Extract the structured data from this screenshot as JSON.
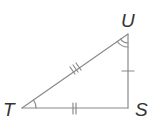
{
  "diagram": {
    "type": "right-triangle",
    "vertices": {
      "T": {
        "label": "T",
        "x": 22,
        "y": 108
      },
      "S": {
        "label": "S",
        "x": 128,
        "y": 108
      },
      "U": {
        "label": "U",
        "x": 128,
        "y": 34
      }
    },
    "sides": [
      {
        "from": "T",
        "to": "U",
        "tick_marks": 3
      },
      {
        "from": "T",
        "to": "S",
        "tick_marks": 2
      },
      {
        "from": "U",
        "to": "S",
        "tick_marks": 1
      }
    ],
    "angle_marks": [
      {
        "vertex": "T",
        "arcs": 1
      },
      {
        "vertex": "U",
        "arcs": 2
      }
    ],
    "colors": {
      "stroke": "#8a8a8a",
      "label": "#333333"
    }
  }
}
